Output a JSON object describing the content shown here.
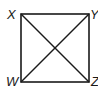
{
  "figure": {
    "type": "square-with-diagonals",
    "vertices": {
      "top_left": "X",
      "top_right": "Y",
      "bottom_left": "W",
      "bottom_right": "Z"
    },
    "segments": [
      "XY",
      "YZ",
      "ZW",
      "WX",
      "XZ",
      "YW"
    ],
    "stroke_color": "#1a1a1a"
  }
}
